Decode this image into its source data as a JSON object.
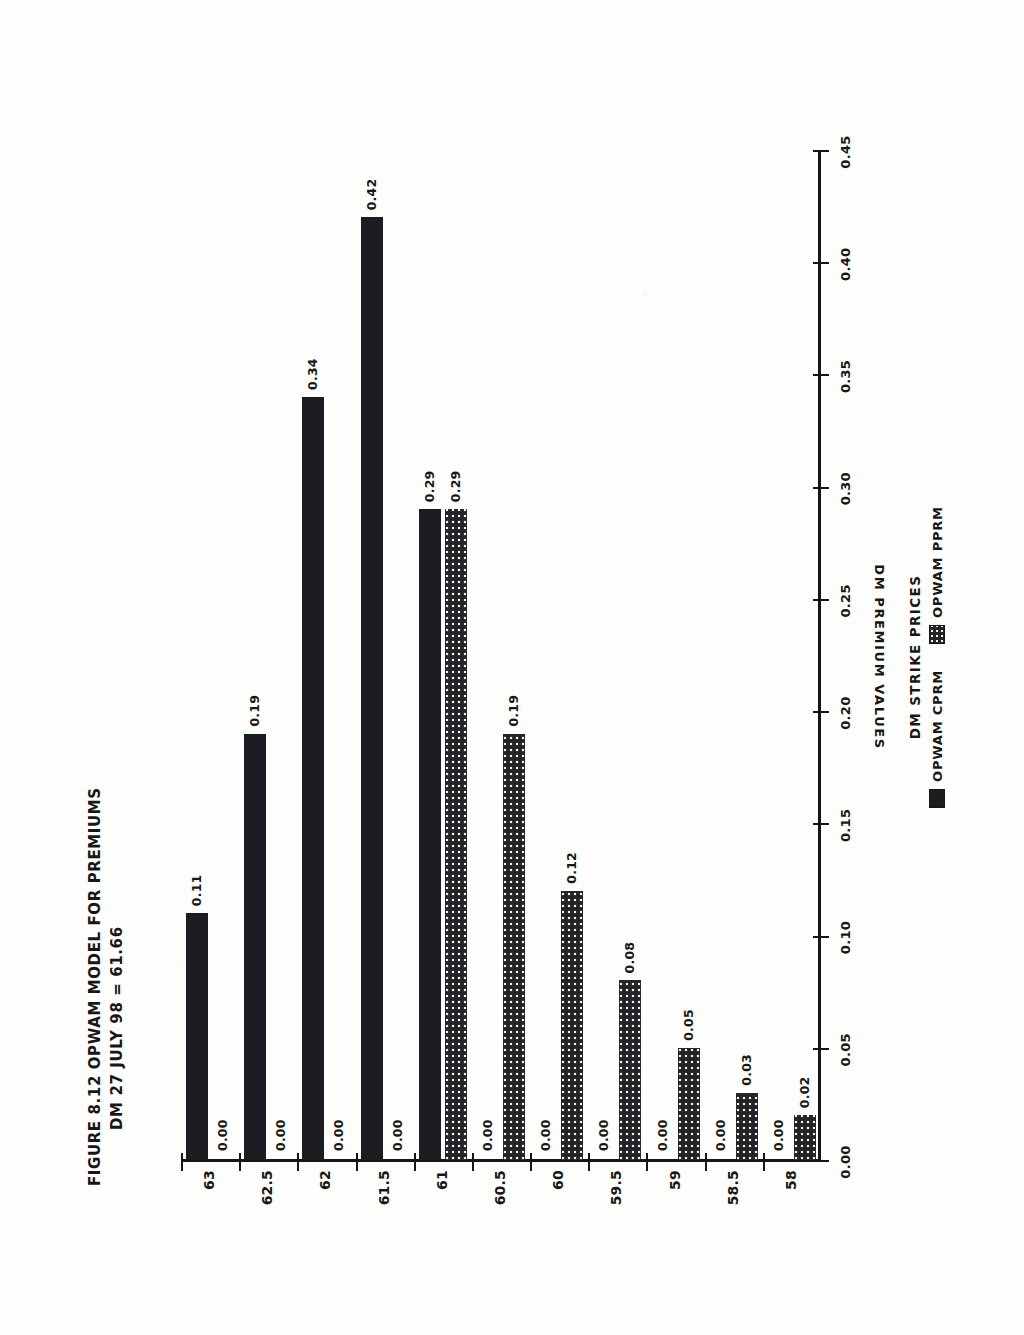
{
  "figure": {
    "title_line_1": "FIGURE 8.12  OPWAM MODEL FOR PREMIUMS",
    "title_line_2": "DM 27 JULY 98 = 61.66"
  },
  "legend": {
    "title": "DM STRIKE PRICES",
    "entries": [
      {
        "label": "OPWAM CPRM",
        "swatch": "solid-black",
        "color": "#1d1d21"
      },
      {
        "label": "OPWAM PPRM",
        "swatch": "dotted-fill",
        "color": "#242428"
      }
    ]
  },
  "axes": {
    "category_axis_label": "DM STRIKE PRICES",
    "value_axis_label": "DM PREMIUM VALUES",
    "value_ticks": [
      "0.00",
      "0.05",
      "0.10",
      "0.15",
      "0.20",
      "0.25",
      "0.30",
      "0.35",
      "0.40",
      "0.45"
    ]
  },
  "chart_data": {
    "type": "bar",
    "orientation": "horizontal",
    "xlabel": "DM PREMIUM VALUES",
    "ylabel": "DM STRIKE PRICES",
    "xlim": [
      0.0,
      0.45
    ],
    "grid": false,
    "legend_position": "below-axis",
    "categories": [
      "58",
      "58.5",
      "59",
      "59.5",
      "60",
      "60.5",
      "61",
      "61.5",
      "62",
      "62.5",
      "63"
    ],
    "series": [
      {
        "name": "OPWAM CPRM",
        "color": "#1d1d21",
        "values": [
          0.0,
          0.0,
          0.0,
          0.0,
          0.0,
          0.0,
          0.29,
          0.42,
          0.34,
          0.19,
          0.11
        ],
        "labels": [
          "0.00",
          "0.00",
          "0.00",
          "0.00",
          "0.00",
          "0.00",
          "0.29",
          "0.42",
          "0.34",
          "0.19",
          "0.11"
        ]
      },
      {
        "name": "OPWAM PPRM",
        "color": "#242428",
        "values": [
          0.02,
          0.03,
          0.05,
          0.08,
          0.12,
          0.19,
          0.29,
          0.0,
          0.0,
          0.0,
          0.0
        ],
        "labels": [
          "0.02",
          "0.03",
          "0.05",
          "0.08",
          "0.12",
          "0.19",
          "0.29",
          "0.00",
          "0.00",
          "0.00",
          "0.00"
        ]
      }
    ]
  }
}
